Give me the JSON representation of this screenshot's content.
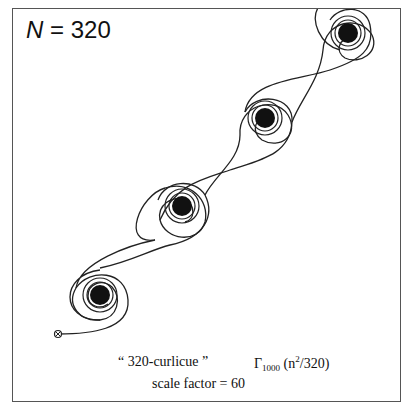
{
  "figure": {
    "n_label_var": "N",
    "n_label_eq": " = 320",
    "caption_name": "“ 320-curlicue ”",
    "caption_gamma": "Γ",
    "caption_sub": "1000",
    "caption_arg_open": " (n",
    "caption_sup": "2",
    "caption_arg_close": "/320)",
    "caption_scale": "scale factor = 60",
    "spiral_centers": [
      [
        100,
        295
      ],
      [
        182,
        206
      ],
      [
        265,
        118
      ],
      [
        348,
        33
      ]
    ],
    "start_marker": [
      58,
      334
    ],
    "line_color": "#222222"
  }
}
